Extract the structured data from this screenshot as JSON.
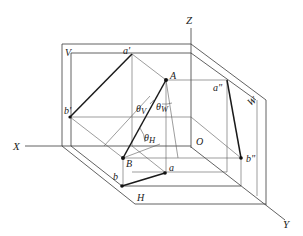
{
  "diagram": {
    "title": "",
    "axes": {
      "x": "X",
      "y": "Y",
      "z": "Z",
      "origin": "O"
    },
    "planes": {
      "vertical": "V",
      "horizontal": "H",
      "side": "W"
    },
    "points": {
      "A": "A",
      "B": "B",
      "a_front": "a'",
      "b_front": "b'",
      "a_side": "a\"",
      "b_side": "b\"",
      "a_top": "a",
      "b_top": "b"
    },
    "angles": {
      "theta_v": "θ",
      "theta_v_sub": "V",
      "theta_w": "θ",
      "theta_w_sub": "W",
      "theta_h": "θ",
      "theta_h_sub": "H"
    },
    "colors": {
      "line": "#3a3a3a",
      "bold": "#1a1a1a",
      "background": "#ffffff"
    }
  }
}
